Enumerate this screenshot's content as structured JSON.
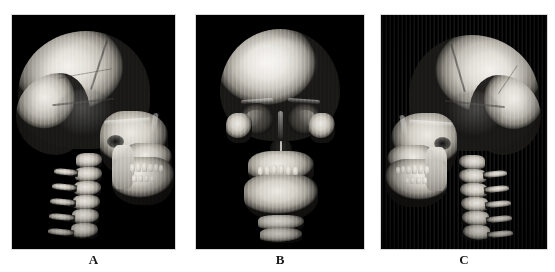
{
  "figure": {
    "type": "medical-imaging-figure",
    "modality": "3D CT volume rendering",
    "background_color": "#ffffff",
    "panel_background_color": "#000000",
    "panel_border_color": "#d8d8d8",
    "bone_highlight_color": "#f4f2ee",
    "bone_midtone_color": "#c3bfb6",
    "bone_shadow_color": "#4a4843",
    "label_color": "#1a1a1a",
    "panel_count": 3
  },
  "panels": [
    {
      "id": "a",
      "label": "A",
      "view": "left lateral",
      "description": "Three-dimensional CT volume rendering of the skull in left lateral projection with the cervical spine visible posteriorly",
      "orientation": "facial skeleton to the right, cervical vertebrae to the left",
      "visible_structures": [
        "cranial vault",
        "frontal bone",
        "parietal bone",
        "occipital bone",
        "coronal suture",
        "zygomatic arch",
        "external auditory meatus",
        "maxilla",
        "mandible",
        "maxillary dentition",
        "cervical vertebrae"
      ],
      "artifacts": "stair-step striping artifact across the cranial vault"
    },
    {
      "id": "b",
      "label": "B",
      "view": "anterior",
      "description": "Three-dimensional CT volume rendering of the skull in frontal projection",
      "orientation": "anteroposterior, symmetric",
      "visible_structures": [
        "frontal bone",
        "supraorbital ridges",
        "left orbit",
        "right orbit",
        "nasal aperture",
        "nasal septum",
        "zygomatic bones",
        "maxilla",
        "mandible",
        "dental arches",
        "cervical vertebra"
      ],
      "artifacts": "stair-step striping artifact across the cranial vault"
    },
    {
      "id": "c",
      "label": "C",
      "view": "right lateral",
      "description": "Three-dimensional CT volume rendering of the skull in right lateral projection with the cervical spine visible posteriorly",
      "orientation": "facial skeleton to the left, cervical vertebrae to the right",
      "visible_structures": [
        "cranial vault",
        "frontal bone",
        "parietal bone",
        "occipital bone",
        "zygomatic arch",
        "external auditory meatus",
        "maxilla",
        "mandible",
        "maxillary dentition",
        "mandibular dentition",
        "cervical vertebrae"
      ],
      "artifacts": "stair-step striping artifact across the cranial vault"
    }
  ]
}
